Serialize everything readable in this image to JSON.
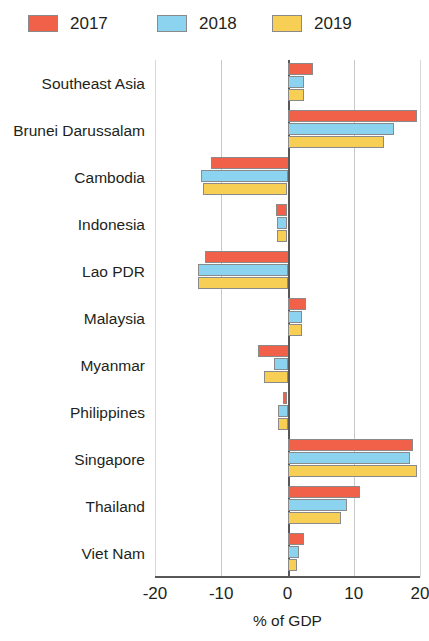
{
  "chart_data": {
    "type": "bar",
    "orientation": "horizontal",
    "title": "",
    "xlabel": "% of GDP",
    "ylabel": "",
    "xlim": [
      -20,
      20
    ],
    "xticks": [
      -20,
      -10,
      0,
      10,
      20
    ],
    "xtick_labels": [
      "-20",
      "-10",
      "0",
      "10",
      "20"
    ],
    "grid": true,
    "grid_axis": "x",
    "legend_position": "top-left",
    "categories": [
      "Southeast Asia",
      "Brunei Darussalam",
      "Cambodia",
      "Indonesia",
      "Lao PDR",
      "Malaysia",
      "Myanmar",
      "Philippines",
      "Singapore",
      "Thailand",
      "Viet Nam"
    ],
    "series": [
      {
        "name": "2017",
        "color": "#F1614A",
        "values": [
          3.8,
          19.5,
          -11.5,
          -1.7,
          -12.5,
          2.8,
          -4.5,
          -0.7,
          19.0,
          11.0,
          2.5
        ]
      },
      {
        "name": "2018",
        "color": "#8BD3EF",
        "values": [
          2.5,
          16.0,
          -13.0,
          -1.6,
          -13.5,
          2.2,
          -2.0,
          -1.5,
          18.5,
          9.0,
          1.8
        ]
      },
      {
        "name": "2019",
        "color": "#F7CF54",
        "values": [
          2.5,
          14.5,
          -12.8,
          -1.6,
          -13.5,
          2.2,
          -3.5,
          -1.5,
          19.5,
          8.0,
          1.5
        ]
      }
    ]
  },
  "legend": {
    "entries": [
      {
        "label": "2017"
      },
      {
        "label": "2018"
      },
      {
        "label": "2019"
      }
    ]
  }
}
